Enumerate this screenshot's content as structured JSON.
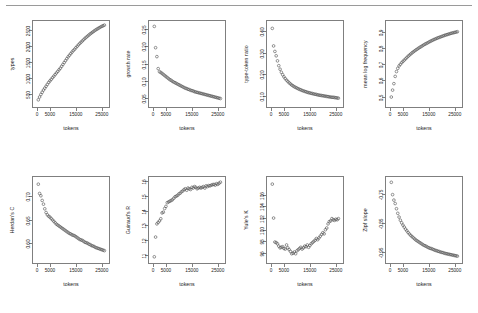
{
  "figure": {
    "rule_color": "#9a9a9a",
    "marker": "open-circle",
    "marker_color": "#4d4d4d",
    "rows": 2,
    "cols": 4,
    "shared_xlabel": "tokens",
    "shared_xticks": [
      "0",
      "5000",
      "15000",
      "25000"
    ]
  },
  "chart_data": [
    {
      "type": "scatter",
      "title": "",
      "xlabel": "tokens",
      "ylabel": "types",
      "xlim": [
        0,
        27000
      ],
      "ylim": [
        200,
        2700
      ],
      "xticks": [
        0,
        5000,
        15000,
        25000
      ],
      "xticklabels": [
        "0",
        "5000",
        "15000",
        "25000"
      ],
      "yticks": [
        500,
        1000,
        1500,
        2000,
        2500
      ],
      "yticklabels": [
        "500",
        "1000",
        "1500",
        "2000",
        "2500"
      ],
      "grid": false,
      "legend": "none",
      "x": [
        500,
        1000,
        1500,
        2000,
        2500,
        3000,
        3500,
        4000,
        4500,
        5000,
        5500,
        6000,
        6500,
        7000,
        7500,
        8000,
        8500,
        9000,
        9500,
        10000,
        10500,
        11000,
        11500,
        12000,
        12500,
        13000,
        13500,
        14000,
        14500,
        15000,
        15500,
        16000,
        16500,
        17000,
        17500,
        18000,
        18500,
        19000,
        19500,
        20000,
        20500,
        21000,
        21500,
        22000,
        22500,
        23000,
        23500,
        24000,
        24500,
        25000,
        25500,
        26000
      ],
      "y": [
        300,
        390,
        470,
        540,
        610,
        670,
        730,
        790,
        850,
        900,
        950,
        1000,
        1050,
        1100,
        1150,
        1200,
        1250,
        1300,
        1360,
        1420,
        1480,
        1540,
        1600,
        1660,
        1710,
        1760,
        1810,
        1860,
        1900,
        1950,
        1995,
        2040,
        2085,
        2125,
        2165,
        2205,
        2245,
        2280,
        2315,
        2350,
        2385,
        2415,
        2445,
        2475,
        2505,
        2530,
        2555,
        2580,
        2605,
        2625,
        2645,
        2665
      ]
    },
    {
      "type": "scatter",
      "title": "",
      "xlabel": "tokens",
      "ylabel": "growth rate",
      "xlim": [
        0,
        27000
      ],
      "ylim": [
        0.035,
        0.265
      ],
      "xticks": [
        0,
        5000,
        15000,
        25000
      ],
      "xticklabels": [
        "0",
        "5000",
        "15000",
        "25000"
      ],
      "yticks": [
        0.05,
        0.1,
        0.15,
        0.2,
        0.25
      ],
      "yticklabels": [
        "0.05",
        "0.10",
        "0.15",
        "0.20",
        "0.25"
      ],
      "grid": false,
      "legend": "none",
      "x": [
        500,
        1000,
        1500,
        2000,
        2500,
        3000,
        3500,
        4000,
        4500,
        5000,
        5500,
        6000,
        6500,
        7000,
        7500,
        8000,
        8500,
        9000,
        9500,
        10000,
        10500,
        11000,
        11500,
        12000,
        12500,
        13000,
        13500,
        14000,
        14500,
        15000,
        15500,
        16000,
        16500,
        17000,
        17500,
        18000,
        18500,
        19000,
        19500,
        20000,
        20500,
        21000,
        21500,
        22000,
        22500,
        23000,
        23500,
        24000,
        24500,
        25000,
        25500,
        26000
      ],
      "y": [
        0.258,
        0.196,
        0.17,
        0.135,
        0.126,
        0.124,
        0.121,
        0.118,
        0.115,
        0.112,
        0.109,
        0.106,
        0.103,
        0.101,
        0.098,
        0.096,
        0.094,
        0.092,
        0.09,
        0.088,
        0.086,
        0.084,
        0.082,
        0.08,
        0.078,
        0.077,
        0.075,
        0.074,
        0.072,
        0.071,
        0.07,
        0.068,
        0.067,
        0.066,
        0.065,
        0.064,
        0.063,
        0.062,
        0.061,
        0.06,
        0.059,
        0.058,
        0.057,
        0.056,
        0.055,
        0.054,
        0.053,
        0.052,
        0.051,
        0.05,
        0.049,
        0.048
      ]
    },
    {
      "type": "scatter",
      "title": "",
      "xlabel": "tokens",
      "ylabel": "type-token ratio",
      "xlim": [
        0,
        27000
      ],
      "ylim": [
        0.07,
        0.43
      ],
      "xticks": [
        0,
        5000,
        15000,
        25000
      ],
      "xticklabels": [
        "0",
        "5000",
        "15000",
        "25000"
      ],
      "yticks": [
        0.1,
        0.2,
        0.3,
        0.4
      ],
      "yticklabels": [
        "0.10",
        "0.20",
        "0.30",
        "0.40"
      ],
      "grid": false,
      "legend": "none",
      "x": [
        500,
        1000,
        1500,
        2000,
        2500,
        3000,
        3500,
        4000,
        4500,
        5000,
        5500,
        6000,
        6500,
        7000,
        7500,
        8000,
        8500,
        9000,
        9500,
        10000,
        10500,
        11000,
        11500,
        12000,
        12500,
        13000,
        13500,
        14000,
        14500,
        15000,
        15500,
        16000,
        16500,
        17000,
        17500,
        18000,
        18500,
        19000,
        19500,
        20000,
        20500,
        21000,
        21500,
        22000,
        22500,
        23000,
        23500,
        24000,
        24500,
        25000,
        25500,
        26000
      ],
      "y": [
        0.41,
        0.33,
        0.305,
        0.285,
        0.262,
        0.24,
        0.224,
        0.21,
        0.199,
        0.189,
        0.181,
        0.174,
        0.168,
        0.162,
        0.157,
        0.152,
        0.148,
        0.144,
        0.141,
        0.138,
        0.135,
        0.132,
        0.13,
        0.127,
        0.125,
        0.123,
        0.121,
        0.119,
        0.117,
        0.116,
        0.114,
        0.113,
        0.111,
        0.11,
        0.109,
        0.107,
        0.106,
        0.105,
        0.104,
        0.103,
        0.102,
        0.101,
        0.1,
        0.099,
        0.098,
        0.097,
        0.096,
        0.096,
        0.095,
        0.094,
        0.093,
        0.092
      ]
    },
    {
      "type": "scatter",
      "title": "",
      "xlabel": "tokens",
      "ylabel": "mean log frequency",
      "xlim": [
        0,
        27000
      ],
      "ylim": [
        0.46,
        0.95
      ],
      "xticks": [
        0,
        5000,
        15000,
        25000
      ],
      "xticklabels": [
        "0",
        "5000",
        "15000",
        "25000"
      ],
      "yticks": [
        0.5,
        0.6,
        0.7,
        0.8,
        0.9
      ],
      "yticklabels": [
        "0.5",
        "0.6",
        "0.7",
        "0.8",
        "0.9"
      ],
      "grid": false,
      "legend": "none",
      "x": [
        500,
        1000,
        1500,
        2000,
        2500,
        3000,
        3500,
        4000,
        4500,
        5000,
        5500,
        6000,
        6500,
        7000,
        7500,
        8000,
        8500,
        9000,
        9500,
        10000,
        10500,
        11000,
        11500,
        12000,
        12500,
        13000,
        13500,
        14000,
        14500,
        15000,
        15500,
        16000,
        16500,
        17000,
        17500,
        18000,
        18500,
        19000,
        19500,
        20000,
        20500,
        21000,
        21500,
        22000,
        22500,
        23000,
        23500,
        24000,
        24500,
        25000,
        25500,
        26000
      ],
      "y": [
        0.497,
        0.54,
        0.58,
        0.625,
        0.655,
        0.675,
        0.69,
        0.7,
        0.71,
        0.718,
        0.726,
        0.734,
        0.742,
        0.75,
        0.757,
        0.764,
        0.771,
        0.777,
        0.783,
        0.789,
        0.794,
        0.8,
        0.805,
        0.81,
        0.815,
        0.82,
        0.825,
        0.829,
        0.833,
        0.838,
        0.842,
        0.846,
        0.85,
        0.854,
        0.857,
        0.861,
        0.864,
        0.867,
        0.87,
        0.873,
        0.876,
        0.879,
        0.882,
        0.884,
        0.887,
        0.889,
        0.892,
        0.894,
        0.896,
        0.898,
        0.9,
        0.902
      ]
    },
    {
      "type": "scatter",
      "title": "",
      "xlabel": "tokens",
      "ylabel": "Herdan's C",
      "xlim": [
        0,
        27000
      ],
      "ylim": [
        0.565,
        0.735
      ],
      "xticks": [
        0,
        5000,
        15000,
        25000
      ],
      "xticklabels": [
        "0",
        "5000",
        "15000",
        "25000"
      ],
      "yticks": [
        0.6,
        0.65,
        0.7
      ],
      "yticklabels": [
        "0.60",
        "0.65",
        "0.70"
      ],
      "grid": false,
      "legend": "none",
      "x": [
        500,
        1000,
        1500,
        2000,
        2500,
        3000,
        3500,
        4000,
        4500,
        5000,
        5500,
        6000,
        6500,
        7000,
        7500,
        8000,
        8500,
        9000,
        9500,
        10000,
        10500,
        11000,
        11500,
        12000,
        12500,
        13000,
        13500,
        14000,
        14500,
        15000,
        15500,
        16000,
        16500,
        17000,
        17500,
        18000,
        18500,
        19000,
        19500,
        20000,
        20500,
        21000,
        21500,
        22000,
        22500,
        23000,
        23500,
        24000,
        24500,
        25000,
        25500,
        26000
      ],
      "y": [
        0.726,
        0.706,
        0.701,
        0.691,
        0.683,
        0.673,
        0.665,
        0.66,
        0.657,
        0.655,
        0.652,
        0.649,
        0.646,
        0.643,
        0.64,
        0.638,
        0.636,
        0.634,
        0.632,
        0.63,
        0.628,
        0.626,
        0.624,
        0.622,
        0.62,
        0.619,
        0.617,
        0.616,
        0.615,
        0.613,
        0.611,
        0.609,
        0.607,
        0.606,
        0.605,
        0.603,
        0.601,
        0.6,
        0.599,
        0.597,
        0.596,
        0.594,
        0.593,
        0.592,
        0.59,
        0.589,
        0.588,
        0.587,
        0.586,
        0.585,
        0.584,
        0.583
      ]
    },
    {
      "type": "scatter",
      "title": "",
      "xlabel": "tokens",
      "ylabel": "Guiraud's R",
      "xlim": [
        0,
        27000
      ],
      "ylim": [
        10.7,
        16.1
      ],
      "xticks": [
        0,
        5000,
        15000,
        25000
      ],
      "xticklabels": [
        "0",
        "5000",
        "15000",
        "25000"
      ],
      "yticks": [
        11,
        12,
        13,
        14,
        15,
        16
      ],
      "yticklabels": [
        "11",
        "12",
        "13",
        "14",
        "15",
        "16"
      ],
      "grid": false,
      "legend": "none",
      "x": [
        500,
        1000,
        1500,
        2000,
        2500,
        3000,
        3500,
        4000,
        4500,
        5000,
        5500,
        6000,
        6500,
        7000,
        7500,
        8000,
        8500,
        9000,
        9500,
        10000,
        10500,
        11000,
        11500,
        12000,
        12500,
        13000,
        13500,
        14000,
        14500,
        15000,
        15500,
        16000,
        16500,
        17000,
        17500,
        18000,
        18500,
        19000,
        19500,
        20000,
        20500,
        21000,
        21500,
        22000,
        22500,
        23000,
        23500,
        24000,
        24500,
        25000,
        25500,
        26000
      ],
      "y": [
        10.85,
        12.2,
        13.1,
        13.2,
        13.3,
        13.45,
        13.85,
        13.9,
        14.15,
        14.3,
        14.55,
        14.6,
        14.65,
        14.7,
        14.75,
        14.85,
        14.95,
        15.0,
        15.05,
        15.15,
        15.2,
        15.3,
        15.35,
        15.45,
        15.5,
        15.4,
        15.55,
        15.5,
        15.45,
        15.6,
        15.55,
        15.65,
        15.6,
        15.5,
        15.55,
        15.6,
        15.55,
        15.6,
        15.65,
        15.55,
        15.7,
        15.65,
        15.72,
        15.7,
        15.75,
        15.78,
        15.8,
        15.75,
        15.85,
        15.8,
        15.88,
        15.95
      ]
    },
    {
      "type": "scatter",
      "title": "",
      "xlabel": "tokens",
      "ylabel": "Yule's K",
      "xlim": [
        0,
        27000
      ],
      "ylim": [
        95.0,
        108.5
      ],
      "xticks": [
        0,
        5000,
        15000,
        25000
      ],
      "xticklabels": [
        "0",
        "5000",
        "15000",
        "25000"
      ],
      "yticks": [
        96,
        98,
        100,
        102,
        104,
        106
      ],
      "yticklabels": [
        "96",
        "98",
        "100",
        "102",
        "104",
        "106"
      ],
      "grid": false,
      "legend": "none",
      "x": [
        500,
        1000,
        1500,
        2000,
        2500,
        3000,
        3500,
        4000,
        4500,
        5000,
        5500,
        6000,
        6500,
        7000,
        7500,
        8000,
        8500,
        9000,
        9500,
        10000,
        10500,
        11000,
        11500,
        12000,
        12500,
        13000,
        13500,
        14000,
        14500,
        15000,
        15500,
        16000,
        16500,
        17000,
        17500,
        18000,
        18500,
        19000,
        19500,
        20000,
        20500,
        21000,
        21500,
        22000,
        22500,
        23000,
        23500,
        24000,
        24500,
        25000,
        25500,
        26000
      ],
      "y": [
        107.8,
        102.0,
        97.9,
        97.8,
        97.6,
        97.2,
        96.9,
        97.0,
        97.1,
        96.8,
        96.7,
        97.4,
        96.9,
        96.6,
        96.3,
        95.9,
        96.0,
        96.2,
        95.9,
        96.4,
        96.6,
        96.8,
        97.0,
        96.7,
        96.9,
        97.2,
        97.1,
        97.4,
        97.0,
        97.3,
        97.6,
        97.8,
        98.0,
        98.2,
        98.5,
        98.3,
        98.6,
        98.9,
        99.2,
        99.5,
        99.3,
        100.0,
        100.3,
        101.0,
        101.4,
        101.5,
        101.9,
        101.7,
        101.6,
        101.8,
        101.7,
        101.9
      ]
    },
    {
      "type": "scatter",
      "title": "",
      "xlabel": "tokens",
      "ylabel": "Zipf slope",
      "xlim": [
        0,
        27000
      ],
      "ylim": [
        -0.975,
        -0.7
      ],
      "xticks": [
        0,
        5000,
        15000,
        25000
      ],
      "xticklabels": [
        "0",
        "5000",
        "15000",
        "25000"
      ],
      "yticks": [
        -0.95,
        -0.85,
        -0.75
      ],
      "yticklabels": [
        "-0.95",
        "-0.85",
        "-0.75"
      ],
      "grid": false,
      "legend": "none",
      "x": [
        500,
        1000,
        1500,
        2000,
        2500,
        3000,
        3500,
        4000,
        4500,
        5000,
        5500,
        6000,
        6500,
        7000,
        7500,
        8000,
        8500,
        9000,
        9500,
        10000,
        10500,
        11000,
        11500,
        12000,
        12500,
        13000,
        13500,
        14000,
        14500,
        15000,
        15500,
        16000,
        16500,
        17000,
        17500,
        18000,
        18500,
        19000,
        19500,
        20000,
        20500,
        21000,
        21500,
        22000,
        22500,
        23000,
        23500,
        24000,
        24500,
        25000,
        25500,
        26000
      ],
      "y": [
        -0.708,
        -0.751,
        -0.77,
        -0.782,
        -0.8,
        -0.816,
        -0.829,
        -0.84,
        -0.849,
        -0.857,
        -0.864,
        -0.871,
        -0.877,
        -0.883,
        -0.888,
        -0.893,
        -0.897,
        -0.901,
        -0.905,
        -0.909,
        -0.912,
        -0.915,
        -0.918,
        -0.921,
        -0.924,
        -0.927,
        -0.929,
        -0.931,
        -0.934,
        -0.936,
        -0.938,
        -0.939,
        -0.941,
        -0.943,
        -0.945,
        -0.946,
        -0.948,
        -0.949,
        -0.951,
        -0.952,
        -0.953,
        -0.955,
        -0.956,
        -0.957,
        -0.958,
        -0.959,
        -0.96,
        -0.961,
        -0.962,
        -0.963,
        -0.964,
        -0.965
      ]
    }
  ]
}
